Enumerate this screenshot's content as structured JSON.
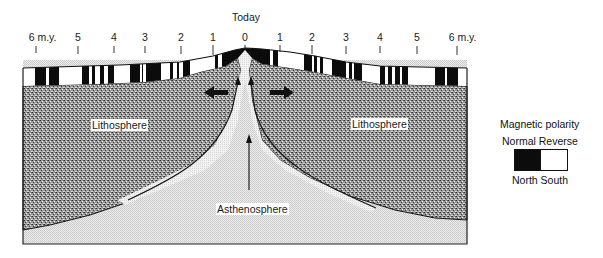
{
  "title": "Today",
  "time_axis": {
    "unit_label": "m.y.",
    "ticks_left": [
      {
        "label": "6 m.y.",
        "x": 37
      },
      {
        "label": "5",
        "x": 78
      },
      {
        "label": "4",
        "x": 114
      },
      {
        "label": "3",
        "x": 145
      },
      {
        "label": "2",
        "x": 180
      },
      {
        "label": "1",
        "x": 213
      }
    ],
    "tick_center": {
      "label": "0",
      "x": 245
    },
    "ticks_right": [
      {
        "label": "1",
        "x": 280
      },
      {
        "label": "2",
        "x": 311
      },
      {
        "label": "3",
        "x": 346
      },
      {
        "label": "4",
        "x": 379
      },
      {
        "label": "5",
        "x": 417
      },
      {
        "label": "6 m.y.",
        "x": 458
      }
    ]
  },
  "regions": {
    "lithosphere_left": "Lithosphere",
    "lithosphere_right": "Lithosphere",
    "asthenosphere": "Asthenosphere"
  },
  "legend": {
    "title": "Magnetic polarity",
    "labels_top": "Normal Reverse",
    "labels_bottom": "North South",
    "normal_color": "#0c0c0c",
    "reverse_color": "#ffffff"
  },
  "colors": {
    "ink": "#111111",
    "lithosphere_fill": "#8a8a8a",
    "asthenosphere_fill": "#e2e2e2",
    "background": "#ffffff"
  }
}
